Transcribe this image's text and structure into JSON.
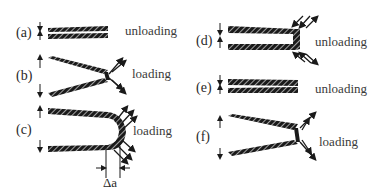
{
  "figure": {
    "panels": [
      {
        "id": "a",
        "label": "(a)",
        "state": "unloading"
      },
      {
        "id": "b",
        "label": "(b)",
        "state": "loading"
      },
      {
        "id": "c",
        "label": "(c)",
        "state": "loading",
        "annotation": "Δa"
      },
      {
        "id": "d",
        "label": "(d)",
        "state": "unloading"
      },
      {
        "id": "e",
        "label": "(e)",
        "state": "unloading"
      },
      {
        "id": "f",
        "label": "(f)",
        "state": "loading"
      }
    ],
    "colors": {
      "ink": "#1a1a1a",
      "text": "#2a2a2a",
      "background": "#ffffff"
    }
  }
}
